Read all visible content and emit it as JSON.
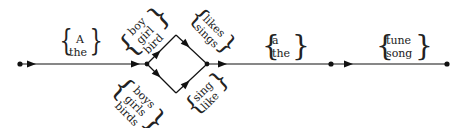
{
  "diagram": {
    "type": "finite-state grammar diagram",
    "edges": {
      "e1": {
        "words": [
          "A",
          "the"
        ]
      },
      "e2_upper": {
        "words": [
          "boy",
          "girl",
          "bird"
        ]
      },
      "e2_lower": {
        "words": [
          "boys",
          "girls",
          "birds"
        ]
      },
      "e3_upper": {
        "words": [
          "likes",
          "sings"
        ]
      },
      "e3_lower": {
        "words": [
          "sing",
          "like"
        ]
      },
      "e4": {
        "words": [
          "a",
          "the"
        ]
      },
      "e5": {
        "words": [
          "tune",
          "song"
        ]
      }
    },
    "colors": {
      "line": "#111111",
      "text": "#222222"
    }
  }
}
